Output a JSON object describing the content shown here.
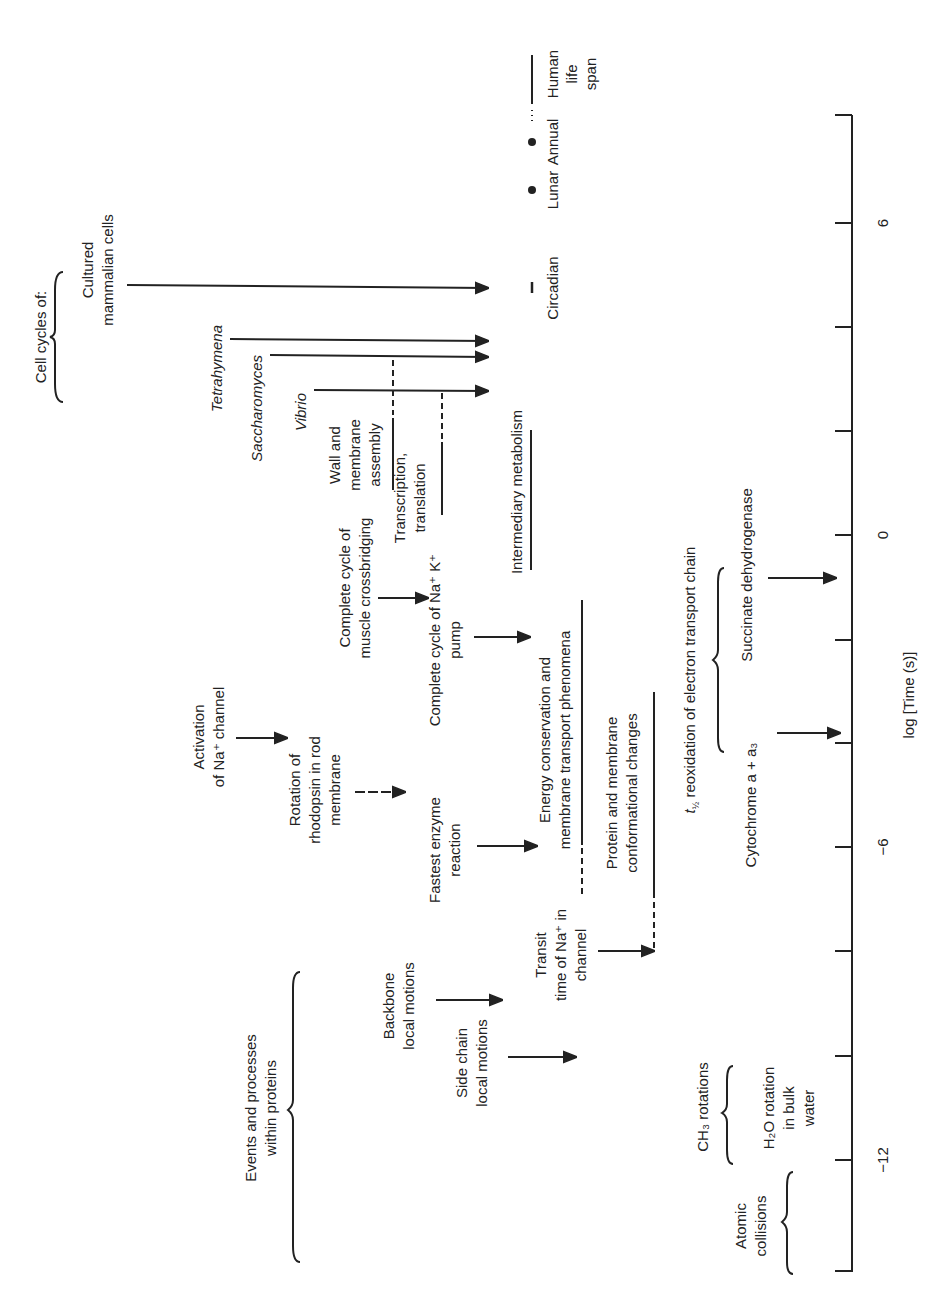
{
  "axis": {
    "title": "log [Time (s)]",
    "range": [
      -14,
      8
    ],
    "tick_step": 2,
    "tick_labels": [
      {
        "value": 6,
        "label": "6"
      },
      {
        "value": 0,
        "label": "0"
      },
      {
        "value": -6,
        "label": "−6"
      },
      {
        "value": -12,
        "label": "−12"
      }
    ]
  },
  "groups": {
    "cell_cycles": "Cell cycles of:",
    "proteins_l1": "Events and processes",
    "proteins_l2": "within proteins",
    "etc_prefix": "t",
    "etc_sub": "½",
    "etc_label": " reoxidation of electron transport chain"
  },
  "cell_cycles": [
    {
      "name": "cultured",
      "l1": "Cultured",
      "l2": "mammalian cells",
      "italic": false
    },
    {
      "name": "tetrahymena",
      "l1": "Tetrahymena",
      "italic": true
    },
    {
      "name": "saccharomyces",
      "l1": "Saccharomyces",
      "italic": true
    },
    {
      "name": "vibrio",
      "l1": "Vibrio",
      "italic": true
    }
  ],
  "rhythms": {
    "circadian": "Circadian",
    "lunar": "Lunar",
    "annual": "Annual",
    "human_l1": "Human",
    "human_l2": "life",
    "human_l3": "span"
  },
  "processes": {
    "wall_l1": "Wall and",
    "wall_l2": "membrane",
    "wall_l3": "assembly",
    "transcription_l1": "Transcription,",
    "transcription_l2": "translation",
    "intermediary": "Intermediary metabolism",
    "muscle_l1": "Complete cycle of",
    "muscle_l2": "muscle crossbridging",
    "pump_l1": "Complete cycle of Na⁺ K⁺",
    "pump_l2": "pump",
    "energy_l1": "Energy conservation and",
    "energy_l2": "membrane transport phenomena",
    "activation_l1": "Activation",
    "activation_l2": "of Na⁺ channel",
    "rhodopsin_l1": "Rotation of",
    "rhodopsin_l2": "rhodopsin in rod",
    "rhodopsin_l3": "membrane",
    "enzyme_l1": "Fastest enzyme",
    "enzyme_l2": "reaction",
    "protein_l1": "Protein and membrane",
    "protein_l2": "conformational changes",
    "transit_l1": "Transit",
    "transit_l2": "time of Na⁺ in",
    "transit_l3": "channel",
    "backbone_l1": "Backbone",
    "backbone_l2": "local motions",
    "sidechain_l1": "Side chain",
    "sidechain_l2": "local motions",
    "succinate": "Succinate dehydrogenase",
    "cytochrome": "Cytochrome a + a₃",
    "ch3": "CH₃ rotations",
    "h2o_l1": "H₂O rotation",
    "h2o_l2": "in bulk",
    "h2o_l3": "water",
    "atomic_l1": "Atomic",
    "atomic_l2": "collisions"
  }
}
